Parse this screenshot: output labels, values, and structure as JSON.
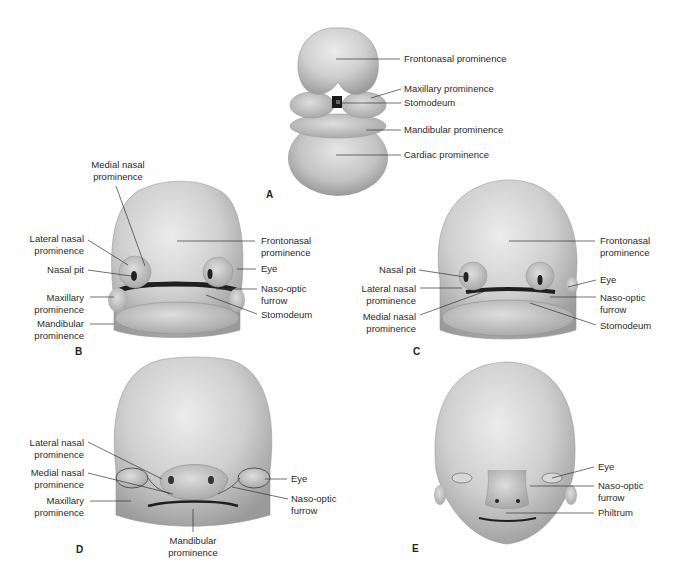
{
  "figure": {
    "panels": [
      {
        "id": "A",
        "letter": "A",
        "labels": [
          {
            "text": "Frontonasal prominence"
          },
          {
            "text": "Maxillary prominence"
          },
          {
            "text": "Stomodeum"
          },
          {
            "text": "Mandibular prominence"
          },
          {
            "text": "Cardiac prominence"
          }
        ]
      },
      {
        "id": "B",
        "letter": "B",
        "labels": [
          {
            "text": "Medial nasal\nprominence",
            "line1": "Medial nasal",
            "line2": "prominence"
          },
          {
            "line1": "Lateral nasal",
            "line2": "prominence"
          },
          {
            "line1": "Nasal pit"
          },
          {
            "line1": "Maxillary",
            "line2": "prominence"
          },
          {
            "line1": "Mandibular",
            "line2": "prominence"
          },
          {
            "line1": "Frontonasal",
            "line2": "prominence"
          },
          {
            "line1": "Eye"
          },
          {
            "line1": "Naso-optic",
            "line2": "furrow"
          },
          {
            "line1": "Stomodeum"
          }
        ]
      },
      {
        "id": "C",
        "letter": "C",
        "labels": [
          {
            "line1": "Nasal pit"
          },
          {
            "line1": "Lateral nasal",
            "line2": "prominence"
          },
          {
            "line1": "Medial nasal",
            "line2": "prominence"
          },
          {
            "line1": "Frontonasal",
            "line2": "prominence"
          },
          {
            "line1": "Eye"
          },
          {
            "line1": "Naso-optic",
            "line2": "furrow"
          },
          {
            "line1": "Stomodeum"
          }
        ]
      },
      {
        "id": "D",
        "letter": "D",
        "labels": [
          {
            "line1": "Lateral nasal",
            "line2": "prominence"
          },
          {
            "line1": "Medial nasal",
            "line2": "prominence"
          },
          {
            "line1": "Maxillary",
            "line2": "prominence"
          },
          {
            "line1": "Mandibular",
            "line2": "prominence"
          },
          {
            "line1": "Eye"
          },
          {
            "line1": "Naso-optic",
            "line2": "furrow"
          }
        ]
      },
      {
        "id": "E",
        "letter": "E",
        "labels": [
          {
            "line1": "Eye"
          },
          {
            "line1": "Naso-optic",
            "line2": "furrow"
          },
          {
            "line1": "Philtrum"
          }
        ]
      }
    ]
  },
  "colors": {
    "background": "#ffffff",
    "skin_light": "#e4e4e4",
    "skin_mid": "#bdbdbd",
    "skin_dark": "#8e8e8e",
    "leader_line": "#333333",
    "text": "#2b2b2b"
  }
}
